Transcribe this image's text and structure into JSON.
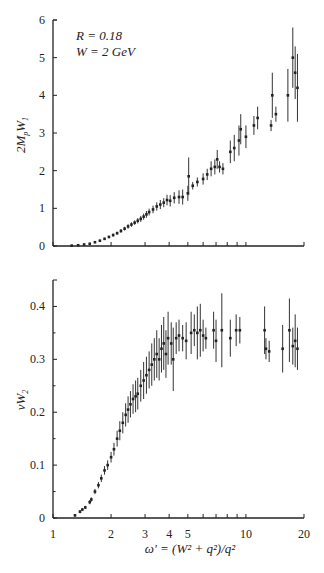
{
  "chart_data": [
    {
      "type": "scatter",
      "panel": "top",
      "title": "",
      "annotations": [
        "R = 0.18",
        "W = 2 GeV"
      ],
      "xlabel": "ω' = (W² + q²)/q²",
      "ylabel": "2MpW1",
      "xscale": "log",
      "xlim": [
        1,
        20
      ],
      "ylim": [
        0,
        6
      ],
      "yticks": [
        0,
        1,
        2,
        3,
        4,
        5,
        6
      ],
      "xticks": [
        1,
        2,
        3,
        4,
        5,
        6,
        7,
        8,
        9,
        10,
        20
      ],
      "grid": false,
      "legend": null,
      "series": [
        {
          "name": "2MpW1 data",
          "points": [
            {
              "x": 1.25,
              "y": 0.01,
              "err": 0.01
            },
            {
              "x": 1.35,
              "y": 0.02,
              "err": 0.01
            },
            {
              "x": 1.45,
              "y": 0.04,
              "err": 0.02
            },
            {
              "x": 1.55,
              "y": 0.06,
              "err": 0.02
            },
            {
              "x": 1.65,
              "y": 0.1,
              "err": 0.02
            },
            {
              "x": 1.75,
              "y": 0.14,
              "err": 0.03
            },
            {
              "x": 1.85,
              "y": 0.19,
              "err": 0.03
            },
            {
              "x": 1.95,
              "y": 0.24,
              "err": 0.03
            },
            {
              "x": 2.05,
              "y": 0.29,
              "err": 0.04
            },
            {
              "x": 2.15,
              "y": 0.34,
              "err": 0.04
            },
            {
              "x": 2.25,
              "y": 0.4,
              "err": 0.05
            },
            {
              "x": 2.35,
              "y": 0.46,
              "err": 0.05
            },
            {
              "x": 2.45,
              "y": 0.52,
              "err": 0.06
            },
            {
              "x": 2.55,
              "y": 0.57,
              "err": 0.06
            },
            {
              "x": 2.65,
              "y": 0.62,
              "err": 0.06
            },
            {
              "x": 2.75,
              "y": 0.67,
              "err": 0.07
            },
            {
              "x": 2.85,
              "y": 0.72,
              "err": 0.08
            },
            {
              "x": 2.95,
              "y": 0.78,
              "err": 0.08
            },
            {
              "x": 3.05,
              "y": 0.84,
              "err": 0.09
            },
            {
              "x": 3.15,
              "y": 0.9,
              "err": 0.09
            },
            {
              "x": 3.3,
              "y": 0.97,
              "err": 0.1
            },
            {
              "x": 3.45,
              "y": 1.05,
              "err": 0.11
            },
            {
              "x": 3.6,
              "y": 1.1,
              "err": 0.12
            },
            {
              "x": 3.75,
              "y": 1.15,
              "err": 0.12
            },
            {
              "x": 3.9,
              "y": 1.22,
              "err": 0.14
            },
            {
              "x": 4.05,
              "y": 1.2,
              "err": 0.15
            },
            {
              "x": 4.25,
              "y": 1.28,
              "err": 0.15
            },
            {
              "x": 4.5,
              "y": 1.3,
              "err": 0.18
            },
            {
              "x": 4.7,
              "y": 1.3,
              "err": 0.2
            },
            {
              "x": 5.0,
              "y": 1.4,
              "err": 0.2
            },
            {
              "x": 5.05,
              "y": 1.85,
              "err": 0.5
            },
            {
              "x": 5.3,
              "y": 1.6,
              "err": 0.1
            },
            {
              "x": 5.6,
              "y": 1.7,
              "err": 0.12
            },
            {
              "x": 6.0,
              "y": 1.78,
              "err": 0.15
            },
            {
              "x": 6.3,
              "y": 1.9,
              "err": 0.15
            },
            {
              "x": 6.6,
              "y": 2.05,
              "err": 0.2
            },
            {
              "x": 6.9,
              "y": 2.1,
              "err": 0.2
            },
            {
              "x": 7.1,
              "y": 2.3,
              "err": 0.25
            },
            {
              "x": 7.3,
              "y": 2.1,
              "err": 0.15
            },
            {
              "x": 7.6,
              "y": 2.05,
              "err": 0.15
            },
            {
              "x": 8.3,
              "y": 2.5,
              "err": 0.3
            },
            {
              "x": 8.7,
              "y": 2.6,
              "err": 0.35
            },
            {
              "x": 9.2,
              "y": 2.8,
              "err": 0.4
            },
            {
              "x": 9.4,
              "y": 3.1,
              "err": 0.4
            },
            {
              "x": 10.0,
              "y": 2.9,
              "err": 0.3
            },
            {
              "x": 11.0,
              "y": 3.2,
              "err": 0.25
            },
            {
              "x": 11.5,
              "y": 3.4,
              "err": 0.3
            },
            {
              "x": 13.5,
              "y": 3.2,
              "err": 0.15
            },
            {
              "x": 13.7,
              "y": 4.0,
              "err": 0.6
            },
            {
              "x": 14.3,
              "y": 3.5,
              "err": 0.2
            },
            {
              "x": 16.5,
              "y": 4.0,
              "err": 0.7
            },
            {
              "x": 17.5,
              "y": 5.0,
              "err": 0.8
            },
            {
              "x": 18.0,
              "y": 4.6,
              "err": 0.7
            },
            {
              "x": 18.5,
              "y": 4.2,
              "err": 0.9
            }
          ]
        }
      ]
    },
    {
      "type": "scatter",
      "panel": "bottom",
      "title": "",
      "xlabel": "ω' = (W² + q²)/q²",
      "ylabel": "νW2",
      "xscale": "log",
      "xlim": [
        1,
        20
      ],
      "ylim": [
        0,
        0.45
      ],
      "yticks": [
        0,
        0.1,
        0.2,
        0.3,
        0.4
      ],
      "xticks": [
        1,
        2,
        3,
        4,
        5,
        6,
        7,
        8,
        9,
        10,
        20
      ],
      "xticklabels": [
        "1",
        "2",
        "3",
        "4",
        "5",
        "10",
        "20"
      ],
      "grid": false,
      "legend": null,
      "series": [
        {
          "name": "νW2 data",
          "points": [
            {
              "x": 1.3,
              "y": 0.005,
              "err": 0.002
            },
            {
              "x": 1.38,
              "y": 0.012,
              "err": 0.003
            },
            {
              "x": 1.42,
              "y": 0.016,
              "err": 0.003
            },
            {
              "x": 1.47,
              "y": 0.02,
              "err": 0.003
            },
            {
              "x": 1.55,
              "y": 0.03,
              "err": 0.004
            },
            {
              "x": 1.58,
              "y": 0.035,
              "err": 0.004
            },
            {
              "x": 1.65,
              "y": 0.05,
              "err": 0.005
            },
            {
              "x": 1.72,
              "y": 0.062,
              "err": 0.006
            },
            {
              "x": 1.78,
              "y": 0.075,
              "err": 0.007
            },
            {
              "x": 1.85,
              "y": 0.09,
              "err": 0.008
            },
            {
              "x": 1.92,
              "y": 0.1,
              "err": 0.009
            },
            {
              "x": 2.0,
              "y": 0.115,
              "err": 0.01
            },
            {
              "x": 2.07,
              "y": 0.13,
              "err": 0.012
            },
            {
              "x": 2.15,
              "y": 0.15,
              "err": 0.015
            },
            {
              "x": 2.22,
              "y": 0.165,
              "err": 0.018
            },
            {
              "x": 2.3,
              "y": 0.18,
              "err": 0.02
            },
            {
              "x": 2.38,
              "y": 0.195,
              "err": 0.022
            },
            {
              "x": 2.45,
              "y": 0.205,
              "err": 0.025
            },
            {
              "x": 2.52,
              "y": 0.215,
              "err": 0.025
            },
            {
              "x": 2.6,
              "y": 0.225,
              "err": 0.028
            },
            {
              "x": 2.68,
              "y": 0.23,
              "err": 0.03
            },
            {
              "x": 2.75,
              "y": 0.235,
              "err": 0.03
            },
            {
              "x": 2.85,
              "y": 0.25,
              "err": 0.03
            },
            {
              "x": 2.95,
              "y": 0.26,
              "err": 0.035
            },
            {
              "x": 3.05,
              "y": 0.27,
              "err": 0.035
            },
            {
              "x": 3.15,
              "y": 0.28,
              "err": 0.035
            },
            {
              "x": 3.25,
              "y": 0.29,
              "err": 0.04
            },
            {
              "x": 3.35,
              "y": 0.3,
              "err": 0.04
            },
            {
              "x": 3.45,
              "y": 0.31,
              "err": 0.045
            },
            {
              "x": 3.55,
              "y": 0.3,
              "err": 0.04
            },
            {
              "x": 3.65,
              "y": 0.32,
              "err": 0.045
            },
            {
              "x": 3.75,
              "y": 0.33,
              "err": 0.05
            },
            {
              "x": 3.85,
              "y": 0.31,
              "err": 0.045
            },
            {
              "x": 3.95,
              "y": 0.34,
              "err": 0.05
            },
            {
              "x": 4.1,
              "y": 0.33,
              "err": 0.04
            },
            {
              "x": 4.2,
              "y": 0.3,
              "err": 0.06
            },
            {
              "x": 4.35,
              "y": 0.34,
              "err": 0.03
            },
            {
              "x": 4.5,
              "y": 0.345,
              "err": 0.03
            },
            {
              "x": 4.7,
              "y": 0.34,
              "err": 0.025
            },
            {
              "x": 4.9,
              "y": 0.335,
              "err": 0.035
            },
            {
              "x": 5.2,
              "y": 0.35,
              "err": 0.04
            },
            {
              "x": 5.4,
              "y": 0.355,
              "err": 0.03
            },
            {
              "x": 5.6,
              "y": 0.35,
              "err": 0.05
            },
            {
              "x": 5.8,
              "y": 0.355,
              "err": 0.05
            },
            {
              "x": 6.0,
              "y": 0.345,
              "err": 0.03
            },
            {
              "x": 6.2,
              "y": 0.34,
              "err": 0.02
            },
            {
              "x": 6.8,
              "y": 0.355,
              "err": 0.035
            },
            {
              "x": 7.0,
              "y": 0.335,
              "err": 0.04
            },
            {
              "x": 7.5,
              "y": 0.355,
              "err": 0.07
            },
            {
              "x": 8.3,
              "y": 0.34,
              "err": 0.035
            },
            {
              "x": 8.9,
              "y": 0.355,
              "err": 0.03
            },
            {
              "x": 9.3,
              "y": 0.355,
              "err": 0.025
            },
            {
              "x": 12.5,
              "y": 0.355,
              "err": 0.045
            },
            {
              "x": 12.7,
              "y": 0.32,
              "err": 0.02
            },
            {
              "x": 13.2,
              "y": 0.315,
              "err": 0.02
            },
            {
              "x": 15.5,
              "y": 0.32,
              "err": 0.045
            },
            {
              "x": 16.8,
              "y": 0.355,
              "err": 0.06
            },
            {
              "x": 17.5,
              "y": 0.325,
              "err": 0.035
            },
            {
              "x": 18.0,
              "y": 0.335,
              "err": 0.05
            },
            {
              "x": 18.5,
              "y": 0.32,
              "err": 0.04
            }
          ]
        }
      ]
    }
  ],
  "labels": {
    "annotation_r": "R = 0.18",
    "annotation_w": "W = 2 GeV",
    "top_ylabel": "2M",
    "top_ylabel_sub1": "p",
    "top_ylabel_mid": "W",
    "top_ylabel_sub2": "1",
    "bottom_ylabel": "νW",
    "bottom_ylabel_sub": "2",
    "xlabel": "ω' = (W² + q²)/q²",
    "top_yticks": [
      "0",
      "1",
      "2",
      "3",
      "4",
      "5",
      "6"
    ],
    "bottom_yticks": [
      "0",
      "0.1",
      "0.2",
      "0.3",
      "0.4"
    ],
    "xticks": [
      "1",
      "2",
      "3",
      "4",
      "5",
      "10",
      "20"
    ]
  }
}
